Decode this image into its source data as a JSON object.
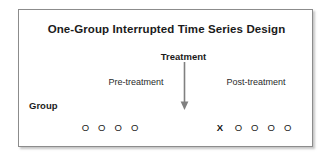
{
  "diagram": {
    "title": "One-Group Interrupted Time Series Design",
    "treatment_label": "Treatment",
    "pre_label": "Pre-treatment",
    "post_label": "Post-treatment",
    "group_label": "Group",
    "treatment_symbol": "X",
    "observation_symbol": "O",
    "pre_observations": [
      "O",
      "O",
      "O",
      "O"
    ],
    "post_observations": [
      "O",
      "O",
      "O",
      "O"
    ],
    "arrow_icon": "down-arrow-icon",
    "colors": {
      "border": "#8c8c8c",
      "text": "#1b1b1b",
      "muted_text": "#2a2a2a",
      "arrow": "#808080",
      "background": "#ffffff"
    }
  }
}
